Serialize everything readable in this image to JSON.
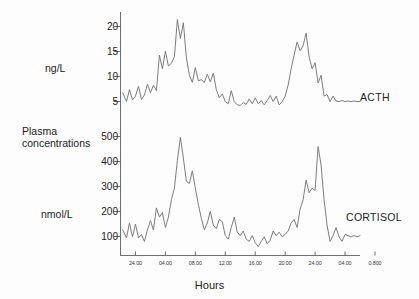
{
  "figure": {
    "title": "",
    "xaxis_title": "Hours",
    "left_label_line1": "Plasma",
    "left_label_line2": "concentrations",
    "background_color": "#fdfdfd",
    "line_color": "#7d7d7d",
    "axis_color": "#6e6e6e",
    "text_color": "#222222"
  },
  "panels": [
    {
      "id": "acth",
      "series_label": "ACTH",
      "unit_label": "ng/L",
      "yticks": [
        20,
        15,
        10,
        5
      ],
      "ytick_labels": [
        "20",
        "15",
        "10",
        "5"
      ]
    },
    {
      "id": "cortisol",
      "series_label": "CORTISOL",
      "unit_label": "nmol/L",
      "yticks": [
        500,
        400,
        300,
        200,
        100
      ],
      "ytick_labels": [
        "500",
        "400",
        "300",
        "200",
        "100"
      ]
    }
  ],
  "xticks": [
    "24.00",
    "04.00",
    "08.00",
    "12.00",
    "16.00",
    "20.00",
    "24.00",
    "04.00",
    "0.800"
  ],
  "chart_data": {
    "type": "line",
    "title": "",
    "xlabel": "Hours",
    "ylabel": "Plasma concentrations",
    "grid": false,
    "legend": "right-of-axes",
    "panels": [
      {
        "name": "ACTH",
        "ylabel": "ng/L",
        "ylim": [
          2,
          21
        ],
        "yticks": [
          5,
          10,
          15,
          20
        ],
        "xlim": [
          22.0,
          54.0
        ],
        "xticks": [
          24,
          28,
          32,
          36,
          40,
          44,
          48,
          52,
          56
        ],
        "xticklabels": [
          "24.00",
          "04.00",
          "08.00",
          "12.00",
          "16.00",
          "20.00",
          "24.00",
          "04.00",
          "0.800"
        ],
        "x": [
          22.3,
          22.8,
          23.2,
          23.6,
          24.0,
          24.4,
          24.8,
          25.2,
          25.6,
          26.0,
          26.4,
          26.8,
          27.2,
          27.6,
          28.0,
          28.4,
          28.8,
          29.2,
          29.6,
          30.0,
          30.4,
          30.8,
          31.2,
          31.6,
          32.0,
          32.4,
          32.8,
          33.2,
          33.6,
          34.0,
          34.4,
          34.8,
          35.2,
          35.6,
          36.0,
          36.4,
          36.8,
          37.2,
          37.6,
          38.0,
          38.4,
          38.8,
          39.2,
          39.6,
          40.0,
          40.4,
          40.8,
          41.2,
          41.6,
          42.0,
          42.4,
          42.8,
          43.2,
          43.6,
          44.0,
          44.4,
          44.8,
          45.2,
          45.6,
          46.0,
          46.4,
          46.8,
          47.2,
          47.6,
          48.0,
          48.4,
          48.8,
          49.2,
          49.6,
          50.0,
          50.4,
          50.8,
          51.2,
          51.6,
          52.0,
          52.4,
          52.8,
          53.2,
          53.6,
          54.0
        ],
        "y": [
          6.6,
          5.0,
          7.2,
          5.3,
          6.0,
          7.8,
          5.4,
          6.2,
          8.2,
          6.6,
          8.0,
          7.0,
          13.5,
          11.0,
          14.2,
          11.5,
          12.0,
          13.2,
          20.0,
          16.5,
          19.4,
          13.0,
          9.8,
          8.5,
          11.2,
          8.8,
          9.0,
          8.5,
          10.0,
          8.6,
          10.2,
          7.2,
          5.7,
          6.4,
          5.0,
          4.6,
          7.0,
          5.0,
          4.4,
          4.3,
          4.8,
          4.5,
          5.5,
          4.6,
          5.7,
          4.6,
          5.2,
          4.4,
          5.2,
          6.1,
          5.0,
          6.0,
          4.4,
          5.0,
          6.0,
          8.0,
          11.0,
          13.5,
          15.9,
          14.3,
          15.2,
          17.5,
          13.2,
          11.0,
          12.1,
          8.4,
          9.8,
          6.0,
          6.3,
          5.0,
          6.0,
          5.1,
          5.0,
          5.2,
          5.0,
          5.1,
          5.0,
          5.1,
          5.0,
          5.0
        ]
      },
      {
        "name": "CORTISOL",
        "ylabel": "nmol/L",
        "ylim": [
          20,
          560
        ],
        "yticks": [
          100,
          200,
          300,
          400,
          500
        ],
        "xlim": [
          22.0,
          54.0
        ],
        "xticks": [
          24,
          28,
          32,
          36,
          40,
          44,
          48,
          52,
          56
        ],
        "xticklabels": [
          "24.00",
          "04.00",
          "08.00",
          "12.00",
          "16.00",
          "20.00",
          "24.00",
          "04.00",
          "0.800"
        ],
        "x": [
          22.3,
          22.8,
          23.2,
          23.6,
          24.0,
          24.4,
          24.8,
          25.2,
          25.6,
          26.0,
          26.4,
          26.8,
          27.2,
          27.6,
          28.0,
          28.4,
          28.8,
          29.2,
          29.6,
          30.0,
          30.4,
          30.8,
          31.2,
          31.6,
          32.0,
          32.4,
          32.8,
          33.2,
          33.6,
          34.0,
          34.4,
          34.8,
          35.2,
          35.6,
          36.0,
          36.4,
          36.8,
          37.2,
          37.6,
          38.0,
          38.4,
          38.8,
          39.2,
          39.6,
          40.0,
          40.4,
          40.8,
          41.2,
          41.6,
          42.0,
          42.4,
          42.8,
          43.2,
          43.6,
          44.0,
          44.4,
          44.8,
          45.2,
          45.6,
          46.0,
          46.4,
          46.8,
          47.2,
          47.6,
          48.0,
          48.4,
          48.8,
          49.2,
          49.6,
          50.0,
          50.4,
          50.8,
          51.2,
          51.6,
          52.0,
          52.4,
          52.8,
          53.2,
          53.6,
          54.0
        ],
        "y": [
          120,
          85,
          150,
          90,
          145,
          85,
          100,
          70,
          120,
          160,
          120,
          215,
          175,
          195,
          130,
          175,
          250,
          300,
          420,
          520,
          430,
          330,
          320,
          375,
          300,
          230,
          170,
          120,
          150,
          200,
          140,
          125,
          165,
          155,
          95,
          80,
          130,
          175,
          110,
          95,
          115,
          80,
          70,
          95,
          65,
          48,
          70,
          90,
          60,
          75,
          115,
          95,
          110,
          90,
          100,
          115,
          150,
          165,
          130,
          210,
          250,
          335,
          280,
          300,
          290,
          480,
          400,
          250,
          140,
          70,
          95,
          130,
          90,
          70,
          100,
          95,
          90,
          95,
          90,
          95
        ]
      }
    ]
  }
}
